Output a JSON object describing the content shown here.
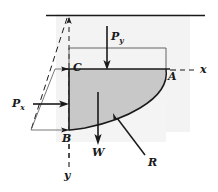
{
  "figure": {
    "type": "engineering-diagram",
    "background_color": "#ffffff",
    "ambient_shade_color": "#f2f2f2",
    "body_shade_color": "#c9c9c9",
    "line_color": "#1a1a1a",
    "labels": {
      "point_c": "C",
      "point_a": "A",
      "point_b": "B",
      "axis_x": "x",
      "axis_y": "y",
      "force_py_letter": "P",
      "force_py_sub": "y",
      "force_px_letter": "P",
      "force_px_sub": "x",
      "force_w": "W",
      "force_r": "R"
    },
    "forces": [
      {
        "name": "Py",
        "label": "P_y",
        "direction": "down",
        "description": "Vertical pressure force on top horizontal surface"
      },
      {
        "name": "Px",
        "label": "P_x",
        "direction": "right",
        "description": "Horizontal pressure force on left vertical face"
      },
      {
        "name": "W",
        "label": "W",
        "direction": "down",
        "description": "Weight of fluid body"
      },
      {
        "name": "R",
        "label": "R",
        "direction": "up-left",
        "description": "Resultant reaction from curved surface"
      }
    ],
    "points": [
      {
        "name": "C",
        "label": "C",
        "role": "top-left corner of fluid body"
      },
      {
        "name": "A",
        "label": "A",
        "role": "top-right corner on curved surface"
      },
      {
        "name": "B",
        "label": "B",
        "role": "bottom-left corner of fluid body"
      }
    ],
    "axes": [
      {
        "name": "x",
        "label": "x",
        "orientation": "horizontal-right",
        "line_style": "dashed"
      },
      {
        "name": "y",
        "label": "y",
        "orientation": "vertical-down",
        "line_style": "dashed"
      }
    ],
    "elements": {
      "free_surface_line": "horizontal solid line at top representing the free surface",
      "pressure_trapezoid": "slanted pressure distribution outline on the left side",
      "py_rectangle": "rectangle outline above line C-A",
      "curved_surface": "curve from B to A bounding the shaded fluid body"
    }
  }
}
